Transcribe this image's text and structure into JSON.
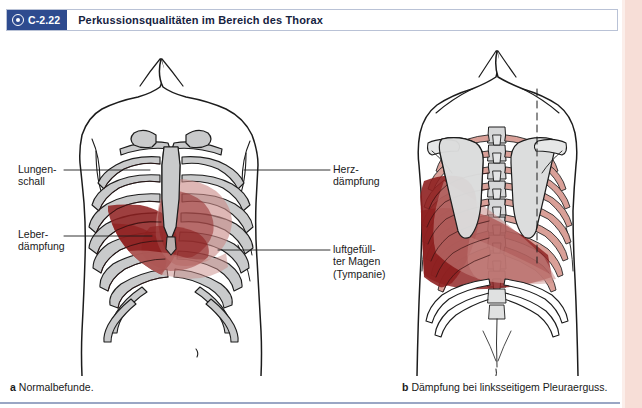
{
  "header": {
    "figure_number": "C-2.22",
    "title": "Perkussionsqualitäten im Bereich des Thorax",
    "badge_icon": "target-icon",
    "badge_color": "#2e4b8f"
  },
  "labels": {
    "lung": "Lungen-\nschall",
    "liver": "Leber-\ndämpfung",
    "heart": "Herz-\ndämpfung",
    "stomach": "luftgefüll-\nter Magen\n(Tympanie)"
  },
  "captions": {
    "a_marker": "a",
    "a_text": "Normalbefunde.",
    "b_marker": "b",
    "b_text": "Dämpfung bei linksseitigem Pleuraerguss."
  },
  "colors": {
    "dullness_dark_red": "#8e2020",
    "dullness_translucent": "#c98b87",
    "bone_gray": "#c9cacb",
    "rib_tint_posterior": "#d79b93",
    "outline": "#1c1c1c",
    "page_margin": "#f7ded7",
    "rule": "#9aa6c4"
  },
  "panels": {
    "a": {
      "view": "anterior-thorax",
      "findings": "Normalbefunde"
    },
    "b": {
      "view": "posterior-thorax",
      "findings": "Dämpfung bei linksseitigem Pleuraerguss"
    }
  }
}
